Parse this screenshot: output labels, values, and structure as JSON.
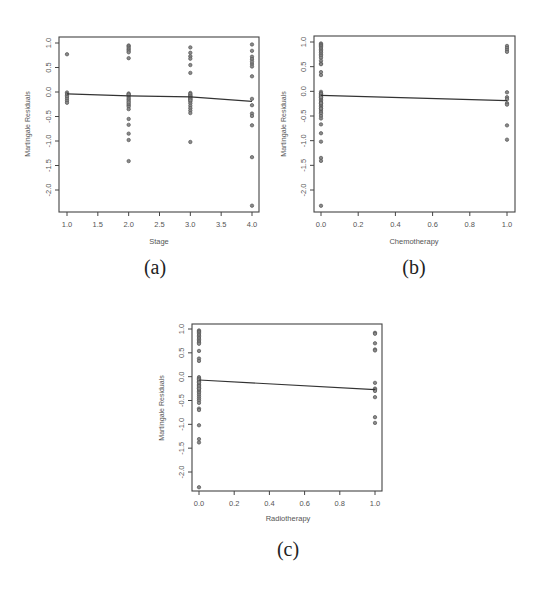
{
  "chart_data": [
    {
      "type": "scatter",
      "caption": "(a)",
      "title": "",
      "xlabel": "Stage",
      "ylabel": "Martingale Residuals",
      "xlim": [
        1.0,
        4.0
      ],
      "ylim": [
        -2.4,
        1.05
      ],
      "xticks": [
        1.0,
        1.5,
        2.0,
        2.5,
        3.0,
        3.5,
        4.0
      ],
      "xtick_labels": [
        "1.0",
        "1.5",
        "2.0",
        "2.5",
        "3.0",
        "3.5",
        "4.0"
      ],
      "yticks": [
        1.0,
        0.5,
        0.0,
        -0.5,
        -1.0,
        -1.5,
        -2.0
      ],
      "ytick_labels": [
        "1.0",
        "0.5",
        "0.0",
        "-0.5",
        "-1.0",
        "-1.5",
        "-2.0"
      ],
      "grid": false,
      "points": {
        "x": [
          1,
          1,
          1,
          1,
          1,
          1,
          1,
          1,
          2,
          2,
          2,
          2,
          2,
          2,
          2,
          2,
          2,
          2,
          2,
          2,
          2,
          2,
          2,
          2,
          2,
          2,
          2,
          2,
          2,
          2,
          2,
          2,
          3,
          3,
          3,
          3,
          3,
          3,
          3,
          3,
          3,
          3,
          3,
          3,
          3,
          3,
          3,
          3,
          3,
          3,
          3,
          3,
          3,
          3,
          3,
          4,
          4,
          4,
          4,
          4,
          4,
          4,
          4,
          4,
          4,
          4,
          4,
          4,
          4,
          4
        ],
        "y": [
          0.77,
          -0.01,
          -0.04,
          -0.07,
          -0.1,
          -0.14,
          -0.18,
          -0.22,
          0.95,
          0.93,
          0.9,
          0.87,
          0.84,
          0.81,
          0.69,
          -0.03,
          -0.06,
          -0.09,
          -0.12,
          -0.15,
          -0.18,
          -0.27,
          -0.3,
          -0.35,
          -0.55,
          -0.67,
          -0.85,
          -0.98,
          -1.41,
          -0.24,
          -0.21,
          -0.05,
          0.91,
          0.8,
          0.73,
          0.68,
          0.55,
          0.39,
          -0.02,
          -0.06,
          -0.09,
          -0.12,
          -0.15,
          -0.19,
          -0.23,
          -0.28,
          -0.33,
          -0.38,
          -0.43,
          -1.02,
          -0.04,
          -0.08,
          -0.11,
          -0.14,
          -0.17,
          0.97,
          0.84,
          0.72,
          0.67,
          0.57,
          0.52,
          0.32,
          -0.14,
          -0.27,
          -0.44,
          -0.49,
          -0.68,
          -1.33,
          -2.32,
          0.62
        ]
      },
      "fit_line": {
        "x": [
          1.0,
          2.0,
          3.0,
          4.0
        ],
        "y": [
          -0.04,
          -0.08,
          -0.1,
          -0.19
        ]
      }
    },
    {
      "type": "scatter",
      "caption": "(b)",
      "title": "",
      "xlabel": "Chemotherapy",
      "ylabel": "Martingale Residuals",
      "xlim": [
        0.0,
        1.0
      ],
      "ylim": [
        -2.4,
        1.05
      ],
      "xticks": [
        0.0,
        0.2,
        0.4,
        0.6,
        0.8,
        1.0
      ],
      "xtick_labels": [
        "0.0",
        "0.2",
        "0.4",
        "0.6",
        "0.8",
        "1.0"
      ],
      "yticks": [
        1.0,
        0.5,
        0.0,
        -0.5,
        -1.0,
        -1.5,
        -2.0
      ],
      "ytick_labels": [
        "1.0",
        "0.5",
        "0.0",
        "-0.5",
        "-1.0",
        "-1.5",
        "-2.0"
      ],
      "grid": false,
      "points": {
        "x": [
          0,
          0,
          0,
          0,
          0,
          0,
          0,
          0,
          0,
          0,
          0,
          0,
          0,
          0,
          0,
          0,
          0,
          0,
          0,
          0,
          0,
          0,
          0,
          0,
          0,
          0,
          0,
          0,
          0,
          0,
          0,
          0,
          0,
          0,
          0,
          0,
          0,
          0,
          0,
          0,
          0,
          0,
          0,
          0,
          1,
          1,
          1,
          1,
          1,
          1,
          1,
          1,
          1,
          1,
          1
        ],
        "y": [
          0.97,
          0.95,
          0.93,
          0.91,
          0.88,
          0.85,
          0.82,
          0.79,
          0.75,
          0.72,
          0.68,
          0.62,
          0.56,
          0.55,
          0.39,
          0.33,
          -0.01,
          -0.04,
          -0.07,
          -0.1,
          -0.13,
          -0.16,
          -0.19,
          -0.22,
          -0.25,
          -0.28,
          -0.31,
          -0.34,
          -0.38,
          -0.42,
          -0.45,
          -0.5,
          -0.55,
          -0.67,
          -0.85,
          -1.02,
          -1.35,
          -1.41,
          -2.32,
          -0.05,
          -0.09,
          -0.12,
          -0.24,
          -0.35,
          0.92,
          0.88,
          0.84,
          0.8,
          -0.02,
          -0.12,
          -0.16,
          -0.24,
          -0.27,
          -0.69,
          -0.98
        ]
      },
      "fit_line": {
        "x": [
          0.0,
          1.0
        ],
        "y": [
          -0.08,
          -0.19
        ]
      }
    },
    {
      "type": "scatter",
      "caption": "(c)",
      "title": "",
      "xlabel": "Radiotherapy",
      "ylabel": "Martingale Residuals",
      "xlim": [
        0.0,
        1.0
      ],
      "ylim": [
        -2.4,
        1.05
      ],
      "xticks": [
        0.0,
        0.2,
        0.4,
        0.6,
        0.8,
        1.0
      ],
      "xtick_labels": [
        "0.0",
        "0.2",
        "0.4",
        "0.6",
        "0.8",
        "1.0"
      ],
      "yticks": [
        1.0,
        0.5,
        0.0,
        -0.5,
        -1.0,
        -1.5,
        -2.0
      ],
      "ytick_labels": [
        "1.0",
        "0.5",
        "0.0",
        "-0.5",
        "-1.0",
        "-1.5",
        "-2.0"
      ],
      "grid": false,
      "points": {
        "x": [
          0,
          0,
          0,
          0,
          0,
          0,
          0,
          0,
          0,
          0,
          0,
          0,
          0,
          0,
          0,
          0,
          0,
          0,
          0,
          0,
          0,
          0,
          0,
          0,
          0,
          0,
          0,
          0,
          0,
          0,
          0,
          0,
          0,
          0,
          0,
          0,
          0,
          0,
          0,
          0,
          0,
          1,
          1,
          1,
          1,
          1,
          1,
          1,
          1,
          1,
          1,
          1,
          1
        ],
        "y": [
          0.97,
          0.95,
          0.93,
          0.9,
          0.87,
          0.84,
          0.81,
          0.78,
          0.75,
          0.72,
          0.69,
          0.54,
          0.38,
          0.33,
          -0.01,
          -0.04,
          -0.07,
          -0.1,
          -0.13,
          -0.16,
          -0.19,
          -0.22,
          -0.25,
          -0.28,
          -0.31,
          -0.34,
          -0.38,
          -0.42,
          -0.46,
          -0.5,
          -0.55,
          -0.67,
          -0.7,
          -1.02,
          -1.31,
          -1.38,
          -2.32,
          -0.06,
          -0.12,
          -0.2,
          -0.25,
          0.92,
          0.9,
          0.7,
          0.57,
          0.55,
          -0.13,
          -0.25,
          -0.27,
          -0.3,
          -0.43,
          -0.85,
          -0.97
        ]
      },
      "fit_line": {
        "x": [
          0.0,
          1.0
        ],
        "y": [
          -0.07,
          -0.27
        ]
      }
    }
  ],
  "layout": {
    "panels": [
      {
        "frame": {
          "left": 59,
          "top": 37,
          "right": 259,
          "bottom": 212
        },
        "x_px": [
          67,
          252
        ],
        "y_px": [
          43,
          190
        ],
        "y_vals": [
          1.0,
          -2.0
        ],
        "caption_pos": {
          "x": 155,
          "y": 256
        },
        "xlabel_pos": {
          "x": 159,
          "y": 244
        },
        "ylabel_pos": {
          "x": 30,
          "y": 124
        }
      },
      {
        "frame": {
          "left": 314,
          "top": 36,
          "right": 515,
          "bottom": 212
        },
        "x_px": [
          321,
          507
        ],
        "y_px": [
          42,
          190
        ],
        "y_vals": [
          1.0,
          -2.0
        ],
        "caption_pos": {
          "x": 414,
          "y": 256
        },
        "xlabel_pos": {
          "x": 414,
          "y": 244
        },
        "ylabel_pos": {
          "x": 286,
          "y": 124
        }
      },
      {
        "frame": {
          "left": 192,
          "top": 324,
          "right": 382,
          "bottom": 491
        },
        "x_px": [
          199,
          375
        ],
        "y_px": [
          329,
          472
        ],
        "y_vals": [
          1.0,
          -2.0
        ],
        "caption_pos": {
          "x": 288,
          "y": 538
        },
        "xlabel_pos": {
          "x": 288,
          "y": 521
        },
        "ylabel_pos": {
          "x": 164,
          "y": 408
        }
      }
    ]
  },
  "colors": {
    "axis": "#444444",
    "point_stroke": "#555555",
    "point_fill": "#8a8a8a",
    "line": "#333333",
    "text": "#555555"
  }
}
